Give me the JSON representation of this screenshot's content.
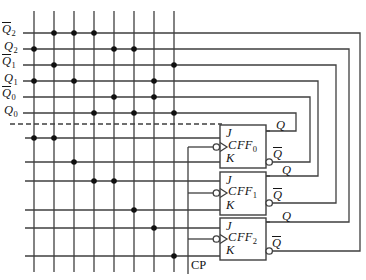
{
  "circuit": {
    "canvas": {
      "w": 366,
      "h": 280
    },
    "colors": {
      "wire": "#3f3f3f",
      "dot": "#101010",
      "text": "#151515",
      "bg": "#ffffff",
      "box_fill": "#ffffff"
    },
    "style": {
      "wire_width": 1.3,
      "box_stroke": 1.4,
      "dot_radius": 2.8,
      "bubble_radius": 3.2,
      "dash": "5 3",
      "wedge_depth": 7,
      "wedge_half_h": 4.5
    },
    "grid": {
      "verticals_x": [
        34,
        54,
        74,
        94,
        114,
        134,
        154,
        174
      ],
      "verticals_top": 11,
      "verticals_bottom": 272,
      "signal_row_left": 23,
      "product_row_left": 25
    },
    "signals": [
      {
        "base": "Q",
        "sub": "2",
        "bar": true,
        "y": 33,
        "label_x": 2,
        "dots": [
          2,
          3,
          4
        ],
        "turn_x": 360,
        "out_y": 251,
        "out_from_x": 272
      },
      {
        "base": "Q",
        "sub": "2",
        "bar": false,
        "y": 49,
        "label_x": 4,
        "dots": [
          1,
          5,
          6
        ],
        "turn_x": 349,
        "out_y": 222,
        "out_from_x": 266
      },
      {
        "base": "Q",
        "sub": "1",
        "bar": true,
        "y": 65,
        "label_x": 2,
        "dots": [
          2,
          8
        ],
        "turn_x": 336,
        "out_y": 203,
        "out_from_x": 272
      },
      {
        "base": "Q",
        "sub": "1",
        "bar": false,
        "y": 81,
        "label_x": 4,
        "dots": [
          1,
          3,
          7
        ],
        "turn_x": 318,
        "out_y": 176,
        "out_from_x": 266
      },
      {
        "base": "Q",
        "sub": "0",
        "bar": true,
        "y": 97,
        "label_x": 2,
        "dots": [
          5,
          7
        ],
        "turn_x": 310,
        "out_y": 162,
        "out_from_x": 272
      },
      {
        "base": "Q",
        "sub": "0",
        "bar": false,
        "y": 113,
        "label_x": 4,
        "dots": [
          4,
          6,
          8
        ],
        "turn_x": 296,
        "out_y": 131,
        "out_from_x": 266
      }
    ],
    "separator": {
      "y": 124,
      "x1": 10,
      "x2": 222
    },
    "product_rows": [
      {
        "y": 138,
        "dots": [
          1,
          2
        ]
      },
      {
        "y": 162,
        "dots": [
          3
        ]
      },
      {
        "y": 181,
        "dots": [
          4,
          5
        ]
      },
      {
        "y": 210,
        "dots": [
          6
        ]
      },
      {
        "y": 228,
        "dots": [
          7
        ]
      },
      {
        "y": 256,
        "dots": [
          8
        ]
      }
    ],
    "ff_common": {
      "x": 220,
      "w": 46,
      "j_label": "J",
      "c_label": "C",
      "k_label": "K",
      "name_label": "FF",
      "q_label": "Q",
      "qbar_label": "Q"
    },
    "flipflops": [
      {
        "sub": "0",
        "top": 125,
        "h": 43,
        "c_y": 147,
        "q_y": 131,
        "qbar_y": 162,
        "q_label_pos": [
          276,
          119
        ],
        "qbar_label_pos": [
          273,
          147
        ]
      },
      {
        "sub": "1",
        "top": 172,
        "h": 43,
        "c_y": 193,
        "q_y": 176,
        "qbar_y": 203,
        "q_label_pos": [
          282,
          164
        ],
        "qbar_label_pos": [
          273,
          188
        ]
      },
      {
        "sub": "2",
        "top": 218,
        "h": 42,
        "c_y": 239,
        "q_y": 222,
        "qbar_y": 251,
        "q_label_pos": [
          282,
          210
        ],
        "qbar_label_pos": [
          272,
          236
        ]
      }
    ],
    "clock": {
      "label": "CP",
      "x": 188,
      "top_y": 147,
      "bottom_y": 274,
      "branch_ys": [
        147,
        193,
        239
      ],
      "label_pos": [
        191,
        259
      ]
    }
  }
}
